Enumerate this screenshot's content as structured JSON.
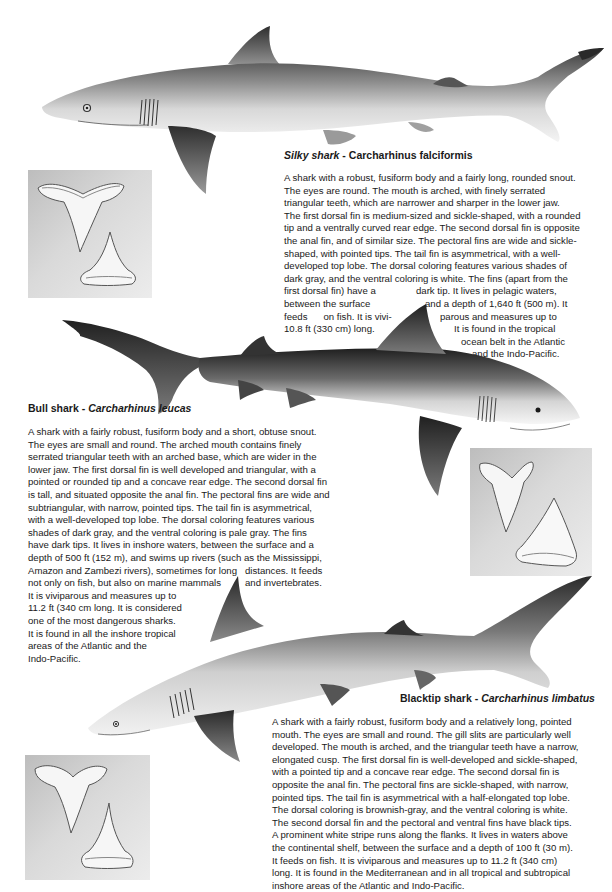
{
  "page": {
    "background": "#ffffff",
    "text_color": "#1a1a1a"
  },
  "species": [
    {
      "common_name": "Silky shark",
      "separator": " - ",
      "scientific_name": "Carcharhinus falciformis",
      "description_lines": [
        "A shark with a robust, fusiform body and a fairly long, rounded snout.",
        "The eyes are round. The mouth is arched, with finely serrated",
        "triangular teeth, which are narrower and sharper in the lower jaw.",
        "The first dorsal fin is medium-sized and sickle-shaped, with a rounded",
        "tip and a ventrally curved rear edge. The second dorsal fin is opposite",
        "the anal fin, and of similar size. The pectoral fins are wide and sickle-",
        "shaped, with pointed tips. The tail fin is asymmetrical, with a well-",
        "developed top lobe. The dorsal coloring features various shades of",
        "dark gray, and the ventral coloring is white. The fins (apart from the"
      ],
      "wrapped_lines": [
        {
          "left": "first dorsal fin) have a",
          "right": "dark tip. It lives in pelagic waters,"
        },
        {
          "left": "between the surface",
          "right": "and a depth of 1,640 ft (500 m). It"
        },
        {
          "left": "feeds      on fish. It is vivi-",
          "right": "parous and measures up to"
        },
        {
          "left": "10.8 ft (330 cm) long.",
          "right": "It is found in the tropical"
        },
        {
          "left": "",
          "right": "ocean belt in the Atlantic"
        },
        {
          "left": "",
          "right": "and the Indo-Pacific."
        }
      ],
      "illustration": "silky-shark-illustration",
      "teeth_image": "silky-shark-teeth"
    },
    {
      "common_name": "Bull shark",
      "separator": " - ",
      "scientific_name": "Carcharhinus leucas",
      "description_lines": [
        "A shark with a fairly robust, fusiform body and a short, obtuse snout.",
        "The eyes are small and round. The arched mouth contains finely",
        "serrated triangular teeth with an arched base, which are wider in the",
        "lower jaw. The first dorsal fin is well developed and triangular, with a",
        "pointed or rounded tip and a concave rear edge. The second dorsal fin",
        "is tall, and situated opposite the anal fin. The pectoral fins are wide and",
        "subtriangular, with narrow, pointed tips. The tail fin is asymmetrical,",
        "with a well-developed top lobe. The dorsal coloring features various",
        "shades of dark gray, and the ventral coloring is pale gray. The fins",
        "have dark tips. It lives in inshore waters, between the surface and a",
        "depth of 500 ft (152 m), and swims up rivers (such as the Mississippi,",
        "Amazon and Zambezi rivers), sometimes for long   distances. It feeds",
        "not only on fish, but also on marine mammals         and invertebrates.",
        "It is viviparous and measures up to",
        "11.2 ft (340 cm long. It is considered",
        "one of the most dangerous sharks.",
        "It is found in all the inshore tropical",
        "areas of the Atlantic and the",
        "Indo-Pacific."
      ],
      "illustration": "bull-shark-illustration",
      "teeth_image": "bull-shark-teeth"
    },
    {
      "common_name": "Blacktip shark",
      "separator": " - ",
      "scientific_name": "Carcharhinus limbatus",
      "description_lines": [
        "A shark with a fairly robust, fusiform body and a relatively long, pointed",
        "mouth. The eyes are small and round. The gill slits are particularly well",
        "developed. The mouth is arched, and the triangular teeth have a narrow,",
        "elongated cusp. The first dorsal fin is well-developed and sickle-shaped,",
        "with a pointed tip and a concave rear edge. The second dorsal fin is",
        "opposite the anal fin. The pectoral fins are sickle-shaped, with narrow,",
        "pointed tips. The tail fin is asymmetrical with a half-elongated top lobe.",
        "The dorsal coloring is brownish-gray, and the ventral coloring is white.",
        "The second dorsal fin and the pectoral and ventral fins have black tips.",
        "A prominent white stripe runs along the flanks. It lives in waters above",
        "the continental shelf, between the surface and a depth of 100 ft (30 m).",
        "It feeds on fish. It is viviparous and measures up to 11.2 ft (340 cm)",
        "long. It is found in the Mediterranean and in all tropical and subtropical",
        "inshore areas of the Atlantic and Indo-Pacific."
      ],
      "illustration": "blacktip-shark-illustration",
      "teeth_image": "blacktip-shark-teeth"
    }
  ]
}
